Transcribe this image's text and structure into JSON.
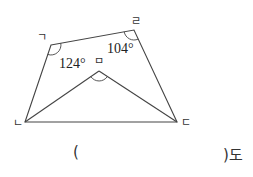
{
  "figure": {
    "vertices": [
      {
        "id": "giyeok",
        "label": "ㄱ",
        "x": 51,
        "y": 45
      },
      {
        "id": "rieul",
        "label": "ㄹ",
        "x": 134,
        "y": 30
      },
      {
        "id": "digeut",
        "label": "ㄷ",
        "x": 177,
        "y": 122
      },
      {
        "id": "nieun",
        "label": "ㄴ",
        "x": 25,
        "y": 122
      },
      {
        "id": "mieum",
        "label": "ㅁ",
        "x": 99,
        "y": 71
      }
    ],
    "angles": {
      "angle_giyeok": "124°",
      "angle_rieul": "104°"
    }
  },
  "answer": {
    "open_paren": "(",
    "close_paren_unit": ")도"
  }
}
